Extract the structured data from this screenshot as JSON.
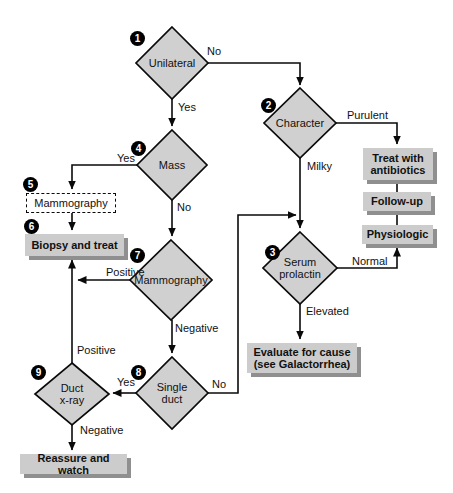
{
  "colors": {
    "node_fill": "#d0d0d0",
    "box_fill": "#cccccc",
    "box_shadow": "#8f8f8f",
    "badge_bg": "#000000",
    "badge_text": "#ffffff",
    "line": "#0a0a0a"
  },
  "steps": {
    "s1": {
      "num": "1",
      "label": "Unilateral"
    },
    "s2": {
      "num": "2",
      "label": "Character"
    },
    "s3": {
      "num": "3",
      "label": "Serum\nprolactin"
    },
    "s4": {
      "num": "4",
      "label": "Mass"
    },
    "s5": {
      "num": "5",
      "label": "Mammography"
    },
    "s6": {
      "num": "6",
      "label": "Biopsy and treat"
    },
    "s7": {
      "num": "7",
      "label": "Mammography"
    },
    "s8": {
      "num": "8",
      "label": "Single\nduct"
    },
    "s9": {
      "num": "9",
      "label": "Duct\nx-ray"
    }
  },
  "boxes": {
    "treat_antibiotics": "Treat with\nantibiotics",
    "follow_up": "Follow-up",
    "physiologic": "Physiologic",
    "evaluate_cause": "Evaluate for cause\n(see Galactorrhea)",
    "reassure": "Reassure and watch"
  },
  "edge_labels": {
    "unilateral_no": "No",
    "unilateral_yes": "Yes",
    "character_purulent": "Purulent",
    "character_milky": "Milky",
    "mass_yes": "Yes",
    "mass_no": "No",
    "mammography_positive": "Positive",
    "mammography_negative": "Negative",
    "prolactin_normal": "Normal",
    "prolactin_elevated": "Elevated",
    "duct_xray_positive": "Positive",
    "duct_xray_negative": "Negative",
    "single_duct_yes": "Yes",
    "single_duct_no": "No"
  }
}
